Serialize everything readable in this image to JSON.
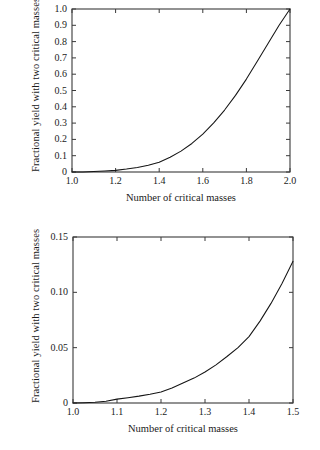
{
  "figure": {
    "background_color": "#ffffff",
    "axis_color": "#3a3a3a",
    "curve_color": "#151515"
  },
  "charts": [
    {
      "id": "top",
      "title": "",
      "xlabel": "Number of critical masses",
      "ylabel": "Fractional yield with two critical masses",
      "xlim": [
        1.0,
        2.0
      ],
      "ylim": [
        0.0,
        1.0
      ],
      "xticks": [
        1.0,
        1.2,
        1.4,
        1.6,
        1.8,
        2.0
      ],
      "xtick_labels": [
        "1.0",
        "1.2",
        "1.4",
        "1.6",
        "1.8",
        "2.0"
      ],
      "yticks": [
        0.0,
        0.1,
        0.2,
        0.3,
        0.4,
        0.5,
        0.6,
        0.7,
        0.8,
        0.9,
        1.0
      ],
      "ytick_labels": [
        "0",
        "0.1",
        "0.2",
        "0.3",
        "0.4",
        "0.5",
        "0.6",
        "0.7",
        "0.8",
        "0.9",
        "1.0"
      ],
      "frame_px": {
        "left": 72,
        "top": 9,
        "right": 290,
        "bottom": 172
      }
    },
    {
      "id": "bottom",
      "title": "",
      "xlabel": "Number of critical masses",
      "ylabel": "Fractional yield with two critical masses",
      "xlim": [
        1.0,
        1.5
      ],
      "ylim": [
        0.0,
        0.15
      ],
      "xticks": [
        1.0,
        1.1,
        1.2,
        1.3,
        1.4,
        1.5
      ],
      "xtick_labels": [
        "1.0",
        "1.1",
        "1.2",
        "1.3",
        "1.4",
        "1.5"
      ],
      "yticks": [
        0.0,
        0.05,
        0.1,
        0.15
      ],
      "ytick_labels": [
        "0",
        "0.05",
        "0.10",
        "0.15"
      ],
      "frame_px": {
        "left": 73,
        "top": 237,
        "right": 293,
        "bottom": 403
      }
    }
  ],
  "chart_data": [
    {
      "type": "line",
      "title": "",
      "xlabel": "Number of critical masses",
      "ylabel": "Fractional yield with two critical masses",
      "xlim": [
        1.0,
        2.0
      ],
      "ylim": [
        0.0,
        1.0
      ],
      "grid": false,
      "legend": "none",
      "series": [
        {
          "name": "Fractional yield",
          "x": [
            1.0,
            1.05,
            1.1,
            1.15,
            1.2,
            1.25,
            1.3,
            1.35,
            1.4,
            1.45,
            1.5,
            1.55,
            1.6,
            1.65,
            1.7,
            1.75,
            1.8,
            1.85,
            1.9,
            1.95,
            2.0
          ],
          "y": [
            0.0,
            0.0006,
            0.0035,
            0.0062,
            0.01,
            0.018,
            0.028,
            0.042,
            0.06,
            0.09,
            0.128,
            0.175,
            0.232,
            0.301,
            0.38,
            0.47,
            0.57,
            0.68,
            0.79,
            0.9,
            1.0
          ]
        }
      ]
    },
    {
      "type": "line",
      "title": "",
      "xlabel": "Number of critical masses",
      "ylabel": "Fractional yield with two critical masses",
      "xlim": [
        1.0,
        1.5
      ],
      "ylim": [
        0.0,
        0.15
      ],
      "grid": false,
      "legend": "none",
      "series": [
        {
          "name": "Fractional yield",
          "x": [
            1.0,
            1.025,
            1.05,
            1.075,
            1.1,
            1.125,
            1.15,
            1.175,
            1.2,
            1.225,
            1.25,
            1.275,
            1.3,
            1.325,
            1.35,
            1.375,
            1.4,
            1.425,
            1.45,
            1.475,
            1.5
          ],
          "y": [
            0.0,
            0.0002,
            0.0006,
            0.0016,
            0.0035,
            0.0048,
            0.0062,
            0.0079,
            0.01,
            0.0135,
            0.018,
            0.0225,
            0.028,
            0.0345,
            0.042,
            0.05,
            0.06,
            0.074,
            0.09,
            0.108,
            0.128
          ]
        }
      ]
    }
  ]
}
